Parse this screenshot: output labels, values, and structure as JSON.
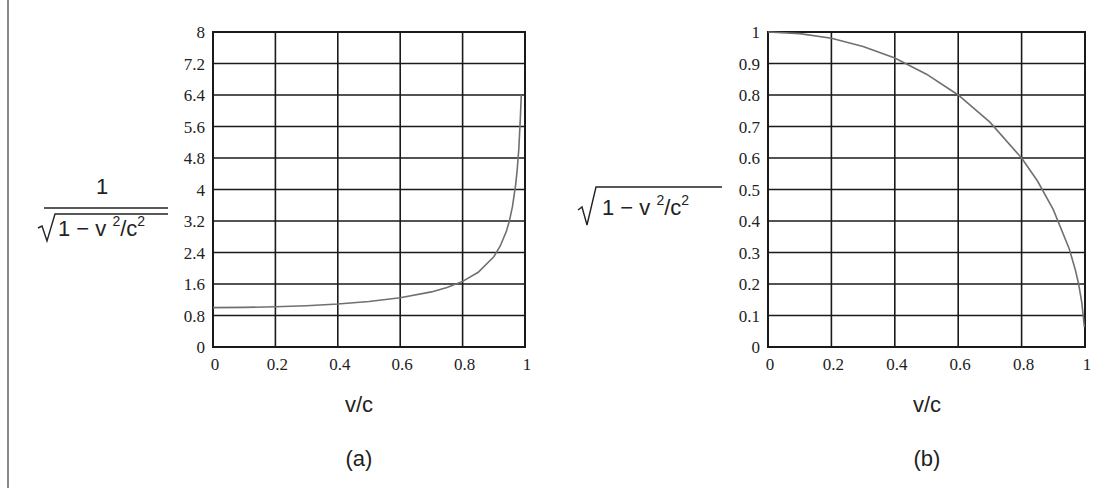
{
  "chart_data": [
    {
      "type": "line",
      "panel_label": "(a)",
      "title": "",
      "xlabel": "v/c",
      "ylabel": {
        "numerator": "1",
        "denominator_prefix": "1 − v ",
        "sup1": "2",
        "mid": "/c",
        "sup2": "2"
      },
      "xlim": [
        0,
        1
      ],
      "ylim": [
        0,
        8
      ],
      "grid": true,
      "x_ticks": [
        "0",
        "0.2",
        "0.4",
        "0.6",
        "0.8",
        "1"
      ],
      "y_ticks": [
        "0",
        "0.8",
        "1.6",
        "2.4",
        "3.2",
        "4",
        "4.8",
        "5.6",
        "6.4",
        "7.2",
        "8"
      ],
      "series": [
        {
          "name": "1/sqrt(1 - v^2/c^2)",
          "color": "#707070",
          "x": [
            0,
            0.1,
            0.2,
            0.3,
            0.4,
            0.5,
            0.6,
            0.7,
            0.75,
            0.8,
            0.85,
            0.9,
            0.92,
            0.94,
            0.95,
            0.96,
            0.97,
            0.975,
            0.98,
            0.985,
            0.988
          ],
          "values": [
            1.0,
            1.005,
            1.021,
            1.048,
            1.091,
            1.155,
            1.25,
            1.4,
            1.512,
            1.667,
            1.898,
            2.294,
            2.552,
            2.931,
            3.203,
            3.571,
            4.113,
            4.5,
            5.025,
            5.795,
            6.4
          ]
        }
      ]
    },
    {
      "type": "line",
      "panel_label": "(b)",
      "title": "",
      "xlabel": "v/c",
      "ylabel": {
        "prefix": "1 − v ",
        "sup1": "2",
        "mid": "/c",
        "sup2": "2"
      },
      "xlim": [
        0,
        1
      ],
      "ylim": [
        0,
        1
      ],
      "grid": true,
      "x_ticks": [
        "0",
        "0.2",
        "0.4",
        "0.6",
        "0.8",
        "1"
      ],
      "y_ticks": [
        "0",
        "0.1",
        "0.2",
        "0.3",
        "0.4",
        "0.5",
        "0.6",
        "0.7",
        "0.8",
        "0.9",
        "1"
      ],
      "series": [
        {
          "name": "sqrt(1 - v^2/c^2)",
          "color": "#707070",
          "x": [
            0,
            0.1,
            0.2,
            0.3,
            0.4,
            0.5,
            0.6,
            0.7,
            0.8,
            0.85,
            0.9,
            0.95,
            0.97,
            0.98,
            0.99,
            0.998
          ],
          "values": [
            1.0,
            0.995,
            0.98,
            0.954,
            0.917,
            0.866,
            0.8,
            0.714,
            0.6,
            0.527,
            0.436,
            0.312,
            0.243,
            0.199,
            0.141,
            0.063
          ]
        }
      ]
    }
  ]
}
